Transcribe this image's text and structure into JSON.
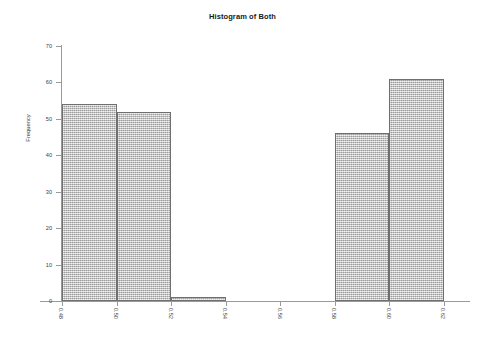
{
  "chart_data": {
    "type": "bar",
    "title": "Histogram of Both",
    "xlabel": "",
    "ylabel": "Frequency",
    "bin_width": 0.02,
    "bin_edges": [
      0.48,
      0.5,
      0.52,
      0.54,
      0.56,
      0.58,
      0.6,
      0.62
    ],
    "categories": [
      "0.48-0.50",
      "0.50-0.52",
      "0.52-0.54",
      "0.54-0.56",
      "0.56-0.58",
      "0.58-0.60",
      "0.60-0.62"
    ],
    "values": [
      54,
      52,
      1,
      0,
      0,
      46,
      61
    ],
    "xlim": [
      0.48,
      0.62
    ],
    "ylim": [
      0,
      70
    ],
    "xticks": [
      "0.48",
      "0.50",
      "0.52",
      "0.54",
      "0.56",
      "0.58",
      "0.60",
      "0.62"
    ],
    "xtick_values": [
      0.48,
      0.5,
      0.52,
      0.54,
      0.56,
      0.58,
      0.6,
      0.62
    ],
    "yticks": [
      "0",
      "10",
      "20",
      "30",
      "40",
      "50",
      "60",
      "70"
    ],
    "ytick_values": [
      0,
      10,
      20,
      30,
      40,
      50,
      60,
      70
    ],
    "grid": false,
    "legend": false,
    "bar_fill_color": "#c2c2c2",
    "bar_border_color": "#6f6f6f",
    "axis_color": "#9a9a9a",
    "text_color": "#3d3d3d"
  }
}
